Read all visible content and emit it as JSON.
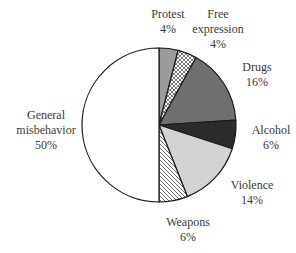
{
  "chart_data": {
    "type": "pie",
    "title": "",
    "start_angle_deg": 0,
    "direction": "clockwise",
    "slices": [
      {
        "label": "Protest",
        "value": 4,
        "display": "4%",
        "fill": "#9b9b9b",
        "pattern": "solid"
      },
      {
        "label": "Free expression",
        "value": 4,
        "display": "4%",
        "fill": "#ffffff",
        "pattern": "crosshatch"
      },
      {
        "label": "Drugs",
        "value": 16,
        "display": "16%",
        "fill": "#6f6f6f",
        "pattern": "solid"
      },
      {
        "label": "Alcohol",
        "value": 6,
        "display": "6%",
        "fill": "#2b2b2b",
        "pattern": "solid"
      },
      {
        "label": "Violence",
        "value": 14,
        "display": "14%",
        "fill": "#d3d3d3",
        "pattern": "solid"
      },
      {
        "label": "Weapons",
        "value": 6,
        "display": "6%",
        "fill": "#ffffff",
        "pattern": "diagonal"
      },
      {
        "label": "General misbehavior",
        "value": 50,
        "display": "50%",
        "fill": "#ffffff",
        "pattern": "solid"
      }
    ]
  },
  "labels": {
    "protest": {
      "line1": "Protest",
      "line2": "4%"
    },
    "free_expression": {
      "line1": "Free",
      "line2": "expression",
      "line3": "4%"
    },
    "drugs": {
      "line1": "Drugs",
      "line2": "16%"
    },
    "alcohol": {
      "line1": "Alcohol",
      "line2": "6%"
    },
    "violence": {
      "line1": "Violence",
      "line2": "14%"
    },
    "weapons": {
      "line1": "Weapons",
      "line2": "6%"
    },
    "general": {
      "line1": "General",
      "line2": "misbehavior",
      "line3": "50%"
    }
  }
}
